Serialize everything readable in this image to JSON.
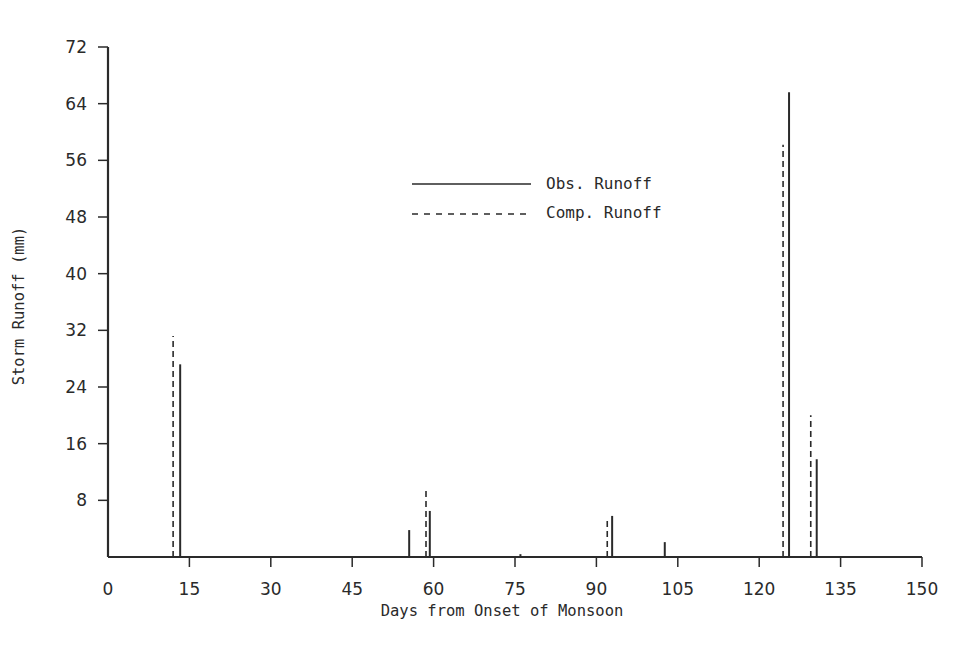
{
  "chart_data": {
    "type": "bar",
    "subtype": "vertical-line-stem",
    "title": "",
    "xlabel": "Days from Onset of Monsoon",
    "ylabel": "Storm Runoff (mm)",
    "xlim": [
      0,
      150
    ],
    "ylim": [
      0,
      72
    ],
    "xticks": [
      0,
      15,
      30,
      45,
      60,
      75,
      90,
      105,
      120,
      135,
      150
    ],
    "yticks": [
      8,
      16,
      24,
      32,
      40,
      48,
      56,
      64,
      72
    ],
    "grid": false,
    "legend_position": "upper-center",
    "series": [
      {
        "name": "Obs. Runoff",
        "style": "solid",
        "points": [
          {
            "x": 13.3,
            "y": 27.2
          },
          {
            "x": 55.5,
            "y": 3.8
          },
          {
            "x": 59.3,
            "y": 6.5
          },
          {
            "x": 76.0,
            "y": 0.4
          },
          {
            "x": 92.9,
            "y": 5.8
          },
          {
            "x": 102.6,
            "y": 2.1
          },
          {
            "x": 125.5,
            "y": 65.6
          },
          {
            "x": 130.6,
            "y": 13.8
          }
        ]
      },
      {
        "name": "Comp. Runoff",
        "style": "dashed",
        "points": [
          {
            "x": 12.0,
            "y": 31.2
          },
          {
            "x": 58.6,
            "y": 9.6
          },
          {
            "x": 92.0,
            "y": 5.5
          },
          {
            "x": 124.4,
            "y": 58.2
          },
          {
            "x": 129.5,
            "y": 20.0
          }
        ]
      }
    ]
  },
  "legend": {
    "items": [
      {
        "label": "Obs. Runoff",
        "style": "solid"
      },
      {
        "label": "Comp. Runoff",
        "style": "dashed"
      }
    ]
  },
  "colors": {
    "ink": "#2a2a2a",
    "background": "#ffffff"
  }
}
